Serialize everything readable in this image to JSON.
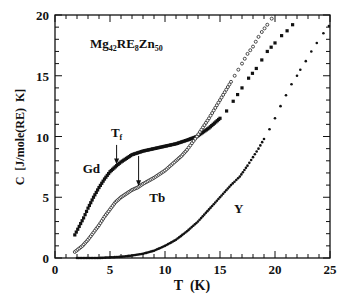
{
  "chart_data": {
    "type": "scatter",
    "title": "Mg42RE8Zn50",
    "title_parts": {
      "base1": "Mg",
      "sub1": "42",
      "base2": "RE",
      "sub2": "8",
      "base3": "Zn",
      "sub3": "50"
    },
    "xlabel": "T  (K)",
    "ylabel": "C  [J/mole(RE)  K]",
    "xlim": [
      0,
      25
    ],
    "ylim": [
      0,
      20
    ],
    "x_ticks": [
      0,
      5,
      10,
      15,
      20,
      25
    ],
    "y_ticks": [
      0,
      5,
      10,
      15,
      20
    ],
    "x_minor_step": 1,
    "y_minor_step": 1,
    "grid": false,
    "legend": "none (curves labeled inline)",
    "series": [
      {
        "name": "Gd",
        "marker": "filled-square",
        "x": [
          1.8,
          2.2,
          2.6,
          3.0,
          3.5,
          4.0,
          4.5,
          5.0,
          5.6,
          6.0,
          6.5,
          7.0,
          8.0,
          9.0,
          10.0,
          11.0,
          12.0,
          12.9,
          14.0,
          15.0,
          15.6,
          16.2,
          17.0,
          17.6,
          18.3,
          18.8,
          19.3,
          20.0,
          20.6,
          21.1,
          21.6
        ],
        "y": [
          1.9,
          2.6,
          3.3,
          4.1,
          5.0,
          5.8,
          6.5,
          7.1,
          7.6,
          7.9,
          8.2,
          8.5,
          8.8,
          9.0,
          9.2,
          9.4,
          9.7,
          10.0,
          10.7,
          11.5,
          12.1,
          12.9,
          14.0,
          14.8,
          15.6,
          16.3,
          17.0,
          17.7,
          18.3,
          18.7,
          19.2
        ]
      },
      {
        "name": "Tb",
        "marker": "open-circle",
        "x": [
          1.8,
          2.5,
          3.0,
          3.5,
          4.0,
          4.5,
          5.0,
          5.5,
          6.0,
          6.5,
          7.0,
          7.5,
          8.0,
          9.0,
          10.0,
          11.0,
          11.5,
          12.0,
          12.9,
          14.0,
          15.0,
          16.0,
          17.0,
          17.5,
          18.0,
          18.5,
          18.8,
          19.3,
          19.7
        ],
        "y": [
          0.5,
          1.0,
          1.5,
          2.1,
          2.7,
          3.4,
          4.0,
          4.6,
          5.0,
          5.3,
          5.6,
          5.8,
          6.1,
          6.6,
          7.2,
          8.0,
          8.4,
          8.9,
          10.0,
          11.5,
          13.0,
          14.5,
          16.0,
          16.8,
          17.4,
          18.2,
          18.6,
          19.2,
          19.7
        ]
      },
      {
        "name": "Y",
        "marker": "filled-dot",
        "x": [
          2.0,
          3.0,
          4.0,
          5.0,
          6.0,
          7.0,
          8.0,
          9.0,
          10.0,
          11.0,
          12.0,
          13.0,
          14.0,
          15.0,
          16.0,
          16.8,
          17.5,
          18.0,
          18.5,
          19.0,
          19.5,
          20.0,
          20.5,
          21.0,
          21.5,
          22.0,
          22.3,
          22.8,
          23.3,
          23.8,
          24.4,
          24.9
        ],
        "y": [
          0.0,
          0.0,
          0.0,
          0.05,
          0.1,
          0.2,
          0.35,
          0.6,
          1.0,
          1.5,
          2.2,
          3.0,
          4.0,
          5.0,
          6.0,
          6.7,
          7.6,
          8.3,
          9.0,
          9.8,
          10.6,
          11.5,
          12.5,
          13.4,
          14.3,
          15.0,
          15.5,
          16.2,
          17.0,
          17.7,
          18.5,
          19.1
        ]
      }
    ],
    "annotations": [
      {
        "text": "Gd",
        "x": 3.3,
        "y": 7.0
      },
      {
        "text": "Tb",
        "x": 9.3,
        "y": 4.6
      },
      {
        "text": "Y",
        "x": 16.7,
        "y": 3.7
      },
      {
        "text": "Tf",
        "x": 5.6,
        "y": 9.8,
        "arrow_to": [
          5.6,
          7.7
        ],
        "label": "T",
        "sub": "f"
      },
      {
        "text": "arrow",
        "x": 7.6,
        "y": 8.4,
        "arrow_to": [
          7.6,
          5.9
        ]
      }
    ]
  }
}
